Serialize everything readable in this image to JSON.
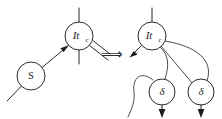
{
  "figure": {
    "rewrite_symbol": "⟹",
    "background_color": "#ffffff",
    "ink_color": "#2b2b2b"
  },
  "left_side": {
    "caption": "redex",
    "nodes": [
      {
        "id": "itc-left",
        "label_main": "It",
        "label_sub": "c",
        "shape": "circle",
        "cx": 79,
        "cy": 36,
        "r": 14
      },
      {
        "id": "s-left",
        "label_main": "S",
        "label_sub": "",
        "shape": "circle",
        "cx": 31,
        "cy": 76,
        "r": 14
      }
    ],
    "edges": [
      {
        "id": "itc-left-top-wire",
        "kind": "free-port"
      },
      {
        "id": "itc-left-bottom-wire",
        "kind": "free-port"
      },
      {
        "id": "itc-left-double-wire",
        "kind": "double-line"
      },
      {
        "id": "s-to-itc",
        "kind": "directed",
        "from": "s-left",
        "to": "itc-left"
      },
      {
        "id": "s-left-tail-wire",
        "kind": "free-port"
      }
    ]
  },
  "right_side": {
    "caption": "contractum",
    "nodes": [
      {
        "id": "itc-right",
        "label_main": "It",
        "label_sub": "c",
        "shape": "circle",
        "cx": 152,
        "cy": 36,
        "r": 14
      },
      {
        "id": "delta-1",
        "label_main": "δ",
        "label_sub": "",
        "shape": "circle",
        "cx": 162,
        "cy": 92,
        "r": 13
      },
      {
        "id": "delta-2",
        "label_main": "δ",
        "label_sub": "",
        "shape": "circle",
        "cx": 201,
        "cy": 92,
        "r": 13
      }
    ],
    "edges": [
      {
        "id": "itc-right-top-wire",
        "kind": "free-port"
      },
      {
        "id": "itc-right-out-arrow",
        "kind": "directed",
        "from": "itc-right",
        "to": "free"
      },
      {
        "id": "itc-right-to-delta-1",
        "kind": "curve",
        "from": "itc-right",
        "to": "delta-1"
      },
      {
        "id": "itc-right-to-delta-2",
        "kind": "curve",
        "from": "itc-right",
        "to": "delta-2"
      },
      {
        "id": "delta-1-hook-wire",
        "kind": "hook"
      },
      {
        "id": "delta-1-out-arrow",
        "kind": "directed-down",
        "from": "delta-1",
        "to": "free"
      },
      {
        "id": "delta-2-out-arrow",
        "kind": "directed-down",
        "from": "delta-2",
        "to": "free"
      }
    ]
  }
}
